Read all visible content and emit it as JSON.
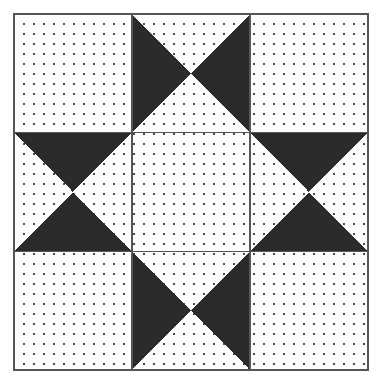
{
  "canvas": {
    "width": 380,
    "height": 386,
    "background": "#ffffff"
  },
  "figure": {
    "kind": "quilt-block",
    "pattern_name": "Hourglass Star Block",
    "grid_rows": 3,
    "grid_cols": 3,
    "frame": {
      "x": 14,
      "y": 14,
      "width": 354,
      "height": 356,
      "border_color": "#555555",
      "border_width": 2
    },
    "cell": {
      "width": 118,
      "height": 118.667,
      "grid_line_color": "#555555",
      "grid_line_width": 1.5
    },
    "colors": {
      "dark": "#2b2b2b",
      "light": "#ffffff",
      "dot": "#4a4a4a",
      "outline": "#555555"
    },
    "dots": {
      "spacing": 10,
      "size": 1.6,
      "color": "#4a4a4a"
    },
    "cells": [
      {
        "row": 0,
        "col": 0,
        "name": "cell-top-left",
        "fill": "stipple",
        "dark_triangles": []
      },
      {
        "row": 0,
        "col": 1,
        "name": "cell-top-center",
        "fill": "bowtie",
        "dark_triangles": [
          "left",
          "right"
        ]
      },
      {
        "row": 0,
        "col": 2,
        "name": "cell-top-right",
        "fill": "stipple",
        "dark_triangles": []
      },
      {
        "row": 1,
        "col": 0,
        "name": "cell-middle-left",
        "fill": "hourglass",
        "dark_triangles": [
          "top",
          "bottom"
        ]
      },
      {
        "row": 1,
        "col": 1,
        "name": "cell-center",
        "fill": "stipple",
        "dark_triangles": []
      },
      {
        "row": 1,
        "col": 2,
        "name": "cell-middle-right",
        "fill": "hourglass",
        "dark_triangles": [
          "top",
          "bottom"
        ]
      },
      {
        "row": 2,
        "col": 0,
        "name": "cell-bottom-left",
        "fill": "stipple",
        "dark_triangles": []
      },
      {
        "row": 2,
        "col": 1,
        "name": "cell-bottom-center",
        "fill": "bowtie",
        "dark_triangles": [
          "left",
          "right"
        ]
      },
      {
        "row": 2,
        "col": 2,
        "name": "cell-bottom-right",
        "fill": "stipple",
        "dark_triangles": []
      }
    ]
  }
}
